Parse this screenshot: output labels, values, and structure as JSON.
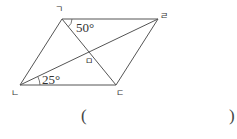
{
  "figure": {
    "type": "parallelogram",
    "vertices": {
      "top_left": {
        "label": "ㄱ",
        "x": 62,
        "y": 19
      },
      "top_right": {
        "label": "ㄹ",
        "x": 158,
        "y": 19
      },
      "bottom_left": {
        "label": "ㄴ",
        "x": 20,
        "y": 85
      },
      "bottom_right": {
        "label": "ㄷ",
        "x": 116,
        "y": 85
      }
    },
    "intersection": {
      "label": "ㅁ",
      "x": 90,
      "y": 54
    },
    "angles": [
      {
        "label": "50°",
        "at": "ㄱ",
        "between": "ㄱㄹ and ㄱㄷ"
      },
      {
        "label": "25°",
        "at": "ㄴ",
        "between": "ㄴㄷ and ㄴㄹ"
      }
    ],
    "line_color": "#555555"
  },
  "answer": {
    "open_paren": "(",
    "close_paren": ")",
    "value": ""
  }
}
